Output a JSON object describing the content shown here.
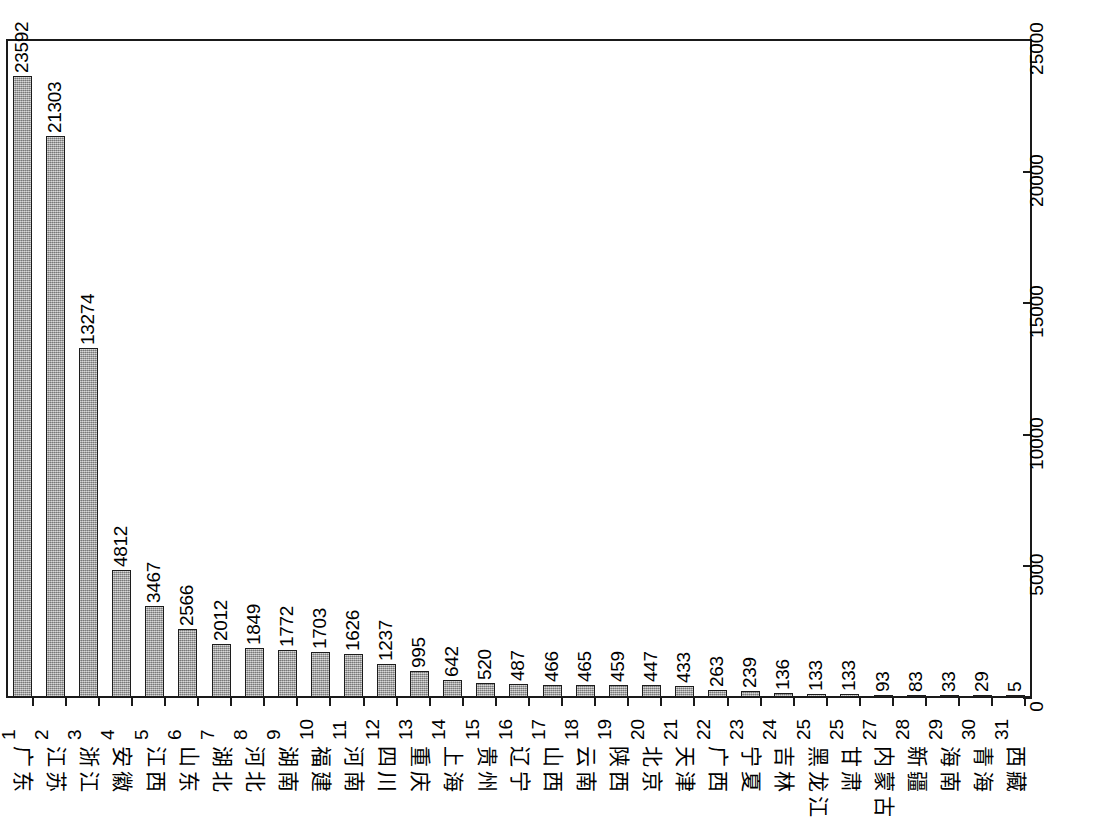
{
  "chart_data": {
    "type": "bar",
    "title": "",
    "subtitle": "",
    "xlabel": "",
    "ylabel": "",
    "ylim": [
      0,
      25000
    ],
    "yticks": [
      0,
      5000,
      10000,
      15000,
      20000,
      25000
    ],
    "ytick_labels": [
      "0",
      "5000",
      "10000",
      "15000",
      "20000",
      "25000"
    ],
    "y_axis_position": "right",
    "grid": false,
    "legend": false,
    "orientation": "vertical",
    "bar_value_labels": true,
    "bar_fill_color": "#9a9a9a",
    "bar_edge_color": "#1c1c1c",
    "background_color": "#ffffff",
    "frame": true,
    "categories": [
      "广东",
      "江苏",
      "浙江",
      "安徽",
      "江西",
      "山东",
      "湖北",
      "河北",
      "湖南",
      "福建",
      "河南",
      "四川",
      "重庆",
      "上海",
      "贵州",
      "辽宁",
      "山西",
      "云南",
      "陕西",
      "北京",
      "天津",
      "广西",
      "宁夏",
      "吉林",
      "黑龙江",
      "甘肃",
      "内蒙古",
      "新疆",
      "海南",
      "青海",
      "西藏"
    ],
    "ranks": [
      "1",
      "2",
      "3",
      "4",
      "5",
      "6",
      "7",
      "8",
      "9",
      "10",
      "11",
      "12",
      "13",
      "14",
      "15",
      "16",
      "17",
      "18",
      "19",
      "20",
      "21",
      "22",
      "23",
      "24",
      "25",
      "25",
      "27",
      "28",
      "29",
      "30",
      "31"
    ],
    "values": [
      23592,
      21303,
      13274,
      4812,
      3467,
      2566,
      2012,
      1849,
      1772,
      1703,
      1626,
      1237,
      995,
      642,
      520,
      487,
      466,
      465,
      459,
      447,
      433,
      263,
      239,
      136,
      133,
      133,
      93,
      83,
      33,
      29,
      5
    ],
    "value_labels": [
      "23592",
      "21303",
      "13274",
      "4812",
      "3467",
      "2566",
      "2012",
      "1849",
      "1772",
      "1703",
      "1626",
      "1237",
      "995",
      "642",
      "520",
      "487",
      "466",
      "465",
      "459",
      "447",
      "433",
      "263",
      "239",
      "136",
      "133",
      "133",
      "93",
      "83",
      "33",
      "29",
      "5"
    ]
  }
}
